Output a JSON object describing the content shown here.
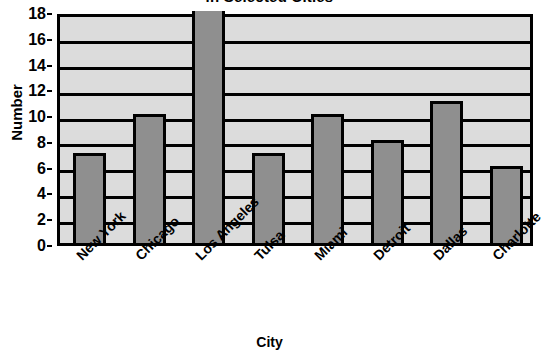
{
  "chart_data": {
    "type": "bar",
    "title": "in Selected Cities",
    "title_note": "title is clipped at the top edge of the screenshot",
    "xlabel": "City",
    "ylabel": "Number",
    "categories": [
      "New York",
      "Chicago",
      "Los Angeles",
      "Tulsa",
      "Miami",
      "Detroit",
      "Dallas",
      "Charlotte"
    ],
    "values": [
      7,
      10,
      18,
      7,
      10,
      8,
      11,
      6
    ],
    "ylim": [
      0,
      18
    ],
    "ytick_step": 2,
    "yticks": [
      0,
      2,
      4,
      6,
      8,
      10,
      12,
      14,
      16,
      18
    ],
    "ytick_labels": [
      "0",
      "2",
      "4",
      "6",
      "8",
      "10",
      "12",
      "14",
      "16",
      "18"
    ],
    "grid": true,
    "grid_orientation": "horizontal",
    "legend": false,
    "legend_position": "none",
    "xtick_rotation": -45,
    "colors": {
      "bar_fill": "#8f8f8f",
      "bar_edge": "#000000",
      "plot_background": "#dcdcdc",
      "gridline": "#000000",
      "axis": "#000000",
      "text": "#000000",
      "page_background": "#ffffff"
    }
  }
}
